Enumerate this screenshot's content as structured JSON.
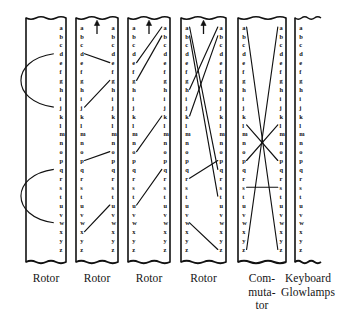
{
  "figure": {
    "alphabet": [
      "a",
      "b",
      "c",
      "d",
      "e",
      "f",
      "g",
      "h",
      "i",
      "j",
      "k",
      "l",
      "m",
      "n",
      "o",
      "p",
      "q",
      "r",
      "s",
      "t",
      "u",
      "v",
      "w",
      "x",
      "y",
      "z"
    ],
    "ink_color": "#111111",
    "paper_color": "#ffffff"
  },
  "units": [
    {
      "id": "unit-1",
      "label": "Rotor",
      "label_lines": [
        "Rotor"
      ],
      "x": 26,
      "width": 40,
      "has_left_rail": true,
      "has_right_rail": true,
      "has_letters_left": false,
      "has_letters_right": true,
      "has_step_arrow": false,
      "wiring_style": "arc",
      "connections": [
        {
          "from": "d",
          "to": "j",
          "kind": "arc"
        },
        {
          "from": "q",
          "to": "w",
          "kind": "arc"
        }
      ]
    },
    {
      "id": "unit-2",
      "label": "Rotor",
      "label_lines": [
        "Rotor"
      ],
      "x": 76,
      "width": 42,
      "has_left_rail": true,
      "has_right_rail": true,
      "has_letters_left": true,
      "has_letters_right": true,
      "has_step_arrow": true,
      "wiring_style": "straight",
      "connections": [
        {
          "from": "d",
          "to": "e",
          "kind": "line"
        },
        {
          "from": "j",
          "to": "g",
          "kind": "line"
        },
        {
          "from": "p",
          "to": "o",
          "kind": "line"
        },
        {
          "from": "x",
          "to": "u",
          "kind": "line"
        }
      ]
    },
    {
      "id": "unit-3",
      "label": "Rotor",
      "label_lines": [
        "Rotor"
      ],
      "x": 128,
      "width": 42,
      "has_left_rail": true,
      "has_right_rail": true,
      "has_letters_left": true,
      "has_letters_right": true,
      "has_step_arrow": true,
      "wiring_style": "straight",
      "connections": [
        {
          "from": "e",
          "to": "a",
          "kind": "line"
        },
        {
          "from": "g",
          "to": "b",
          "kind": "line"
        },
        {
          "from": "o",
          "to": "k",
          "kind": "line"
        },
        {
          "from": "u",
          "to": "q",
          "kind": "line"
        }
      ]
    },
    {
      "id": "unit-4",
      "label": "Rotor",
      "label_lines": [
        "Rotor"
      ],
      "x": 181,
      "width": 45,
      "has_left_rail": true,
      "has_right_rail": true,
      "has_letters_left": true,
      "has_letters_right": true,
      "has_step_arrow": true,
      "wiring_style": "crossed",
      "connections": [
        {
          "from": "a",
          "to": "q",
          "kind": "line"
        },
        {
          "from": "b",
          "to": "t",
          "kind": "line"
        },
        {
          "from": "h",
          "to": "a",
          "kind": "line"
        },
        {
          "from": "k",
          "to": "b",
          "kind": "line"
        },
        {
          "from": "r",
          "to": "p",
          "kind": "line"
        },
        {
          "from": "w",
          "to": "z",
          "kind": "line"
        }
      ]
    },
    {
      "id": "unit-5",
      "label": "Com-muta-tor",
      "label_lines": [
        "Com-",
        "muta-",
        "tor"
      ],
      "x": 238,
      "width": 48,
      "has_left_rail": true,
      "has_right_rail": true,
      "has_letters_left": true,
      "has_letters_right": true,
      "has_step_arrow": false,
      "wiring_style": "crossed",
      "connections": [
        {
          "from": "a",
          "to": "z",
          "kind": "line"
        },
        {
          "from": "z",
          "to": "a",
          "kind": "line"
        },
        {
          "from": "l",
          "to": "p",
          "kind": "line"
        },
        {
          "from": "p",
          "to": "l",
          "kind": "line"
        },
        {
          "from": "s",
          "to": "s",
          "kind": "line"
        }
      ]
    },
    {
      "id": "unit-6",
      "label": "Keyboard Glowlamps",
      "label_lines": [
        "Keyboard",
        "Glowlamps"
      ],
      "x": 295,
      "width": 26,
      "has_left_rail": true,
      "has_right_rail": false,
      "has_letters_left": true,
      "has_letters_right": false,
      "has_step_arrow": false,
      "wiring_style": "none",
      "connections": []
    }
  ],
  "geometry": {
    "box_top": 18,
    "box_bottom": 262,
    "letter_top": 27,
    "letter_step": 8.9,
    "label_top": 272
  }
}
